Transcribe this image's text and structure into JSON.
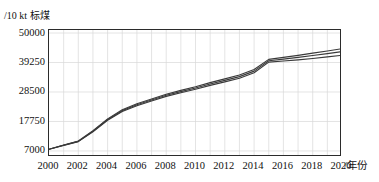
{
  "chart_data": {
    "type": "line",
    "title": "",
    "xlabel": "/年份",
    "ylabel": "/10 kt 标煤",
    "x": [
      2000,
      2001,
      2002,
      2003,
      2004,
      2005,
      2006,
      2007,
      2008,
      2009,
      2010,
      2011,
      2012,
      2013,
      2014,
      2015,
      2016,
      2017,
      2018,
      2019,
      2020
    ],
    "xlim": [
      2000,
      2020
    ],
    "ylim": [
      4800,
      51100
    ],
    "xticks": [
      "2000",
      "2002",
      "2004",
      "2006",
      "2008",
      "2010",
      "2012",
      "2014",
      "2016",
      "2018",
      "2020"
    ],
    "yticks": [
      "7000",
      "17750",
      "28500",
      "39250",
      "50000"
    ],
    "ytick_values": [
      7000,
      17750,
      28500,
      39250,
      50000
    ],
    "grid": true,
    "grid_color": "#d8d8d8",
    "legend": "none",
    "line_color": "#3a3a3a",
    "series": [
      {
        "name": "情景一",
        "values": [
          7600,
          9050,
          10400,
          14000,
          18200,
          21400,
          23500,
          25200,
          26900,
          28200,
          29500,
          30900,
          32200,
          33500,
          35500,
          39400,
          39800,
          40200,
          40700,
          41300,
          41900
        ]
      },
      {
        "name": "情景二",
        "values": [
          7600,
          9100,
          10500,
          14200,
          18450,
          21700,
          23850,
          25600,
          27300,
          28650,
          29950,
          31400,
          32750,
          34100,
          36100,
          39900,
          40500,
          41100,
          41800,
          42500,
          43200
        ]
      },
      {
        "name": "情景三",
        "values": [
          7600,
          9150,
          10600,
          14400,
          18700,
          22000,
          24200,
          25950,
          27700,
          29100,
          30400,
          31900,
          33300,
          34700,
          36700,
          40400,
          41100,
          41850,
          42650,
          43450,
          44300
        ]
      }
    ]
  }
}
